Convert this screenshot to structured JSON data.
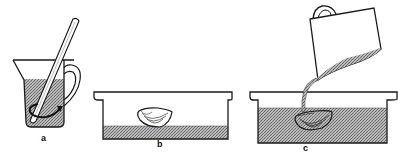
{
  "figure": {
    "colors": {
      "outline": "#1a1a1a",
      "liquid_fill": "#9a9a9a",
      "background": "#ffffff"
    },
    "panels": [
      {
        "id": "a",
        "label": "a",
        "caption": "Stir mixture in measuring jug"
      },
      {
        "id": "b",
        "label": "b",
        "caption": "Object placed in empty tray with thin base layer"
      },
      {
        "id": "c",
        "label": "c",
        "caption": "Pour mixture from jug over object in tray"
      }
    ]
  }
}
